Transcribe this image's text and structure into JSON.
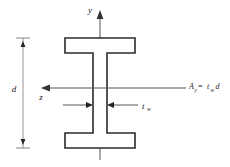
{
  "figure": {
    "background_color": "#ffffff",
    "outline_color": "#2b2b2b",
    "axis_color": "#555555"
  },
  "axes": {
    "vertical": {
      "label": "y",
      "direction": "up",
      "name": "y-axis"
    },
    "horizontal": {
      "label": "z",
      "direction": "left",
      "name": "z-axis"
    }
  },
  "dimensions": {
    "depth": {
      "label": "d",
      "name": "overall-depth",
      "position": "left"
    },
    "web_thickness": {
      "label": "t",
      "subscript": "w",
      "name": "web-thickness",
      "position": "center"
    }
  },
  "annotation": {
    "formula": {
      "symbol": "A",
      "symbol_subscript": "y",
      "equals": " = ",
      "term1": "t",
      "term1_subscript": "w",
      "term2": "d",
      "full_text": "A_y = t_w d",
      "name": "shear-area-formula"
    }
  },
  "geometry": {
    "flange_left_x": 65,
    "flange_right_x": 135,
    "top_flange_top_y": 38,
    "top_flange_bottom_y": 53,
    "bottom_flange_top_y": 133,
    "bottom_flange_bottom_y": 148,
    "web_left_x": 93,
    "web_right_x": 107,
    "centerline_x": 100,
    "z_axis_y": 88
  }
}
